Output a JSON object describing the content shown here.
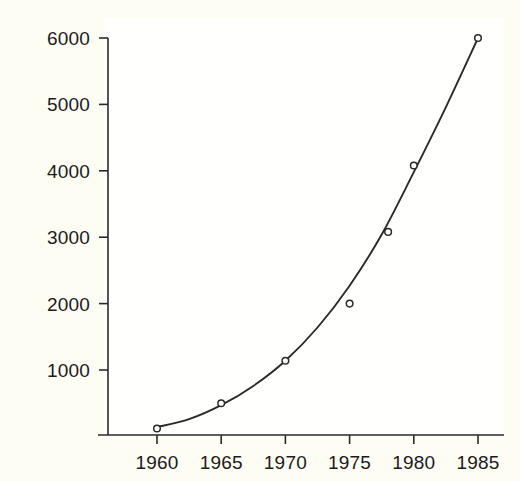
{
  "chart_data": {
    "type": "scatter",
    "title": "",
    "subtitle": "",
    "xlabel": "",
    "ylabel": "",
    "xlim": [
      1957,
      1987
    ],
    "ylim": [
      20,
      6260
    ],
    "grid": false,
    "legend": null,
    "annotations": [],
    "marker_style": "open-circle",
    "curve_style": "smooth-fitted-line",
    "x_tick_labels": [
      "1960",
      "1965",
      "1970",
      "1975",
      "1980",
      "1985"
    ],
    "x_ticks": [
      1960,
      1965,
      1970,
      1975,
      1980,
      1985
    ],
    "y_tick_labels": [
      "1000",
      "2000",
      "3000",
      "4000",
      "5000",
      "6000"
    ],
    "y_ticks": [
      1000,
      2000,
      3000,
      4000,
      5000,
      6000
    ],
    "x": [
      1960,
      1965,
      1970,
      1975,
      1978,
      1980,
      1985
    ],
    "values": [
      120,
      500,
      1140,
      2000,
      3080,
      4080,
      6000
    ],
    "points": [
      {
        "x": 1960,
        "y": 120
      },
      {
        "x": 1965,
        "y": 500
      },
      {
        "x": 1970,
        "y": 1140
      },
      {
        "x": 1975,
        "y": 2000
      },
      {
        "x": 1978,
        "y": 3080
      },
      {
        "x": 1980,
        "y": 4080
      },
      {
        "x": 1985,
        "y": 6000
      }
    ],
    "fitted_curve": [
      {
        "x": 1960.0,
        "y": 140
      },
      {
        "x": 1962.5,
        "y": 260
      },
      {
        "x": 1965.0,
        "y": 470
      },
      {
        "x": 1967.5,
        "y": 760
      },
      {
        "x": 1970.0,
        "y": 1140
      },
      {
        "x": 1972.5,
        "y": 1640
      },
      {
        "x": 1975.0,
        "y": 2270
      },
      {
        "x": 1977.5,
        "y": 3040
      },
      {
        "x": 1980.0,
        "y": 3980
      },
      {
        "x": 1982.5,
        "y": 4960
      },
      {
        "x": 1985.0,
        "y": 6000
      }
    ]
  },
  "axes": {
    "color": "#2a2a2a",
    "marker_color": "#2a2a2a",
    "curve_color": "#2a2a2a",
    "background": "#fdfdf4"
  }
}
